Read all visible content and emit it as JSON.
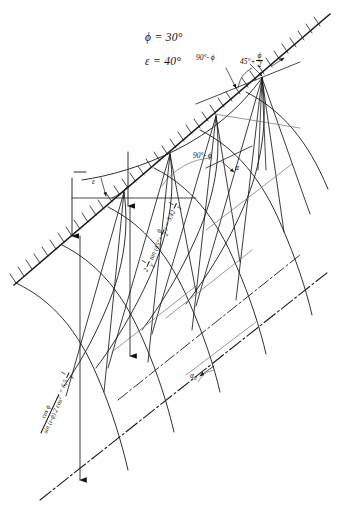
{
  "figure": {
    "kind": "slip-line-field-diagram",
    "ink_color": "#1a1a1a",
    "paper_color": "#fefefe"
  },
  "given": {
    "friction_angle": "ϕ = 30°",
    "slope_angle": "ε = 40°"
  },
  "angles": {
    "top_left": "90°- ϕ",
    "top_right_prefix": "45°+",
    "top_right_fraction_num": "ϕ",
    "top_right_fraction_den": "2",
    "mid_left": "90°- ϕ",
    "mid_right": "α",
    "slope_epsilon": "ε",
    "lower_right": "α",
    "lower_right_sub": "0"
  },
  "formulas": {
    "upper": {
      "lead": "2",
      "lead_frac_num": "l",
      "lead_frac_den": "γ",
      "fn": "tan (45°+",
      "fn_frac_num": "ϕ",
      "fn_frac_den": "2",
      "fn_close": ")",
      "equals": "= 3,42",
      "result_frac_num": "l",
      "result_frac_den": "γ"
    },
    "lower": {
      "num": "cos ϕ",
      "den_a": "sin (ε-ϕ)",
      "den_b": "2 cos",
      "den_b_sup": "2",
      "equals": "= 6,5",
      "result_frac_num": "l",
      "result_frac_den": "γ"
    }
  }
}
